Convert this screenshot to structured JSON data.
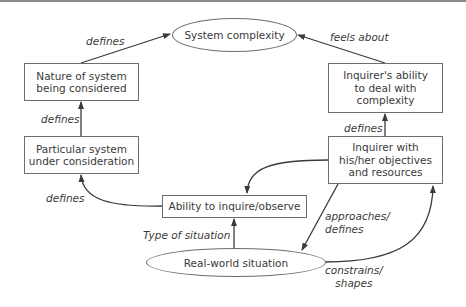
{
  "diagram": {
    "nodes": {
      "system_complexity": "System complexity",
      "nature_of_system": "Nature of system\nbeing considered",
      "particular_system": "Particular system\nunder consideration",
      "ability_to_inquire": "Ability to inquire/observe",
      "real_world": "Real-world situation",
      "inquirer_ability": "Inquirer's ability\nto deal with\ncomplexity",
      "inquirer": "Inquirer with\nhis/her objectives\nand resources"
    },
    "edges": {
      "nature_to_complexity": "defines",
      "particular_to_nature": "defines",
      "ability_to_particular": "defines",
      "realworld_to_ability": "Type of situation",
      "inquirer_to_realworld": "approaches/\ndefines",
      "realworld_to_inquirer": "constrains/\nshapes",
      "inquirer_to_inquirer_ability": "defines",
      "inquirer_ability_to_complexity": "feels about"
    },
    "colors": {
      "line": "#3a3a3a",
      "border": "#6e6e6e",
      "text": "#3a3a3a"
    }
  }
}
